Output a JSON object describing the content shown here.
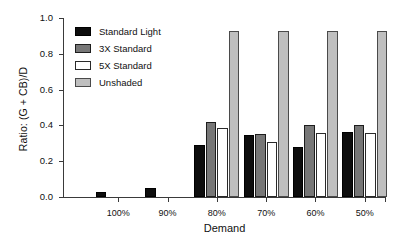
{
  "chart_data": {
    "type": "bar",
    "title": "",
    "xlabel": "Demand",
    "ylabel": "Ratio: (G + CB)/D",
    "categories": [
      "100%",
      "90%",
      "80%",
      "70%",
      "60%",
      "50%"
    ],
    "ylim": [
      0.0,
      1.0
    ],
    "ytick_labels": [
      "0.0",
      "0.2",
      "0.4",
      "0.6",
      "0.8",
      "1.0"
    ],
    "ytick_values": [
      0.0,
      0.2,
      0.4,
      0.6,
      0.8,
      1.0
    ],
    "grid": false,
    "legend_position": "upper-left-inside",
    "series": [
      {
        "name": "Standard Light",
        "color": "#0d0d0d",
        "values": [
          0.03,
          0.05,
          0.29,
          0.345,
          0.28,
          0.365
        ]
      },
      {
        "name": "3X Standard",
        "color": "#777777",
        "values": [
          0.0,
          0.0,
          0.42,
          0.35,
          0.405,
          0.405
        ]
      },
      {
        "name": "5X Standard",
        "color": "#ffffff",
        "values": [
          0.0,
          0.0,
          0.385,
          0.31,
          0.36,
          0.36
        ]
      },
      {
        "name": "Unshaded",
        "color": "#bfbfbf",
        "values": [
          0.0,
          0.0,
          0.925,
          0.925,
          0.925,
          0.93
        ]
      }
    ]
  }
}
